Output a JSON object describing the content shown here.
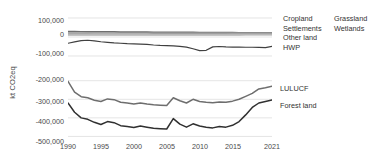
{
  "axes": {
    "ylabel": "kt CO2eq",
    "upper_yticks": [
      "100,000",
      "0",
      "-100,000"
    ],
    "lower_yticks": [
      "-200,000",
      "-300,000",
      "-400,000",
      "-500,000"
    ],
    "xticks": [
      "1990",
      "1995",
      "2000",
      "2005",
      "2010",
      "2015",
      "2021"
    ],
    "xlim": [
      1990,
      2021
    ],
    "upper_ylim": [
      -100000,
      100000
    ],
    "lower_ylim": [
      -530000,
      -180000
    ]
  },
  "legend": {
    "top_left": [
      "Cropland",
      "Settlements",
      "Other land",
      "HWP"
    ],
    "top_right": [
      "Grassland",
      "Wetlands"
    ],
    "bottom": [
      "LULUCF",
      "Forest land"
    ]
  },
  "colors": {
    "dark": "#404040",
    "mid": "#6e6e6e",
    "light": "#a8a8a8",
    "grid": "#d9d9d9",
    "text": "#4a4a4a"
  },
  "chart_data": {
    "type": "line",
    "title": "",
    "xlabel": "",
    "ylabel": "kt CO2eq",
    "grid": true,
    "legend_position": "right",
    "broken_axis": true,
    "x": [
      1990,
      1991,
      1992,
      1993,
      1994,
      1995,
      1996,
      1997,
      1998,
      1999,
      2000,
      2001,
      2002,
      2003,
      2004,
      2005,
      2006,
      2007,
      2008,
      2009,
      2010,
      2011,
      2012,
      2013,
      2014,
      2015,
      2016,
      2017,
      2018,
      2019,
      2020,
      2021
    ],
    "panels": [
      {
        "name": "upper",
        "ylim": [
          -100000,
          100000
        ],
        "yticks": [
          100000,
          0,
          -100000
        ],
        "series": [
          {
            "name": "Cropland",
            "color": "#6e6e6e",
            "values": [
              30000,
              29500,
              29000,
              28800,
              28500,
              28200,
              28000,
              27800,
              27500,
              27300,
              27000,
              26800,
              26600,
              26400,
              26200,
              26000,
              25800,
              25600,
              25400,
              25200,
              25000,
              24800,
              24600,
              24400,
              24200,
              24000,
              23800,
              23600,
              23400,
              23200,
              23000,
              22800
            ]
          },
          {
            "name": "Settlements",
            "color": "#8c8c8c",
            "values": [
              22000,
              22100,
              22200,
              22200,
              22300,
              22300,
              22400,
              22400,
              22500,
              22500,
              22600,
              22600,
              22700,
              22700,
              22800,
              22800,
              22900,
              22900,
              23000,
              23000,
              23100,
              23100,
              23200,
              23200,
              23300,
              23300,
              23400,
              23400,
              23500,
              23500,
              23600,
              23600
            ]
          },
          {
            "name": "Grassland",
            "color": "#9e9e9e",
            "values": [
              16000,
              16200,
              16400,
              16500,
              16600,
              16700,
              16800,
              16900,
              17000,
              17000,
              17100,
              17200,
              17200,
              17300,
              17300,
              17400,
              17400,
              17500,
              17500,
              17600,
              17600,
              17700,
              17700,
              17800,
              17800,
              17900,
              17900,
              18000,
              18000,
              18100,
              18100,
              18200
            ]
          },
          {
            "name": "Other land",
            "color": "#b5b5b5",
            "values": [
              12000,
              12100,
              12100,
              12200,
              12200,
              12300,
              12300,
              12400,
              12400,
              12500,
              12500,
              12600,
              12600,
              12700,
              12700,
              12800,
              12800,
              12900,
              12900,
              13000,
              13000,
              13100,
              13100,
              13200,
              13200,
              13300,
              13300,
              13400,
              13400,
              13500,
              13500,
              13600
            ]
          },
          {
            "name": "Wetlands",
            "color": "#c4c4c4",
            "values": [
              8000,
              8050,
              8100,
              8150,
              8200,
              8200,
              8250,
              8300,
              8350,
              8400,
              8400,
              8450,
              8500,
              8550,
              8600,
              8600,
              8650,
              8700,
              8750,
              8800,
              8800,
              8850,
              8900,
              8950,
              9000,
              9000,
              9050,
              9100,
              9150,
              9200,
              9200,
              9250
            ]
          },
          {
            "name": "HWP",
            "color": "#404040",
            "values": [
              -33000,
              -26000,
              -19000,
              -17000,
              -20000,
              -25000,
              -28000,
              -31000,
              -33000,
              -35000,
              -36000,
              -37000,
              -39000,
              -42000,
              -44000,
              -45000,
              -47000,
              -49000,
              -53000,
              -62000,
              -72000,
              -70000,
              -52000,
              -50000,
              -52000,
              -53000,
              -53000,
              -54000,
              -54000,
              -55000,
              -56000,
              -49000
            ]
          }
        ]
      },
      {
        "name": "lower",
        "ylim": [
          -530000,
          -180000
        ],
        "yticks": [
          -200000,
          -300000,
          -400000,
          -500000
        ],
        "series": [
          {
            "name": "LULUCF",
            "color": "#6e6e6e",
            "values": [
              -203000,
              -262000,
              -286000,
              -292000,
              -305000,
              -312000,
              -298000,
              -302000,
              -316000,
              -320000,
              -326000,
              -320000,
              -326000,
              -330000,
              -332000,
              -334000,
              -292000,
              -308000,
              -320000,
              -300000,
              -312000,
              -316000,
              -318000,
              -314000,
              -316000,
              -310000,
              -300000,
              -284000,
              -268000,
              -244000,
              -238000,
              -230000
            ]
          },
          {
            "name": "Forest land",
            "color": "#303030",
            "values": [
              -320000,
              -370000,
              -400000,
              -408000,
              -424000,
              -436000,
              -420000,
              -426000,
              -442000,
              -446000,
              -452000,
              -444000,
              -450000,
              -456000,
              -458000,
              -460000,
              -404000,
              -434000,
              -450000,
              -432000,
              -444000,
              -450000,
              -454000,
              -446000,
              -450000,
              -440000,
              -420000,
              -384000,
              -344000,
              -320000,
              -312000,
              -304000
            ]
          }
        ]
      }
    ]
  }
}
